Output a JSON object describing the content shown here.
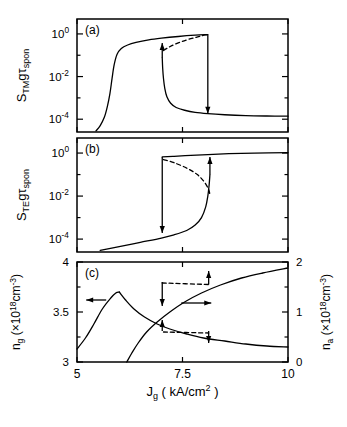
{
  "figure": {
    "background": "#ffffff",
    "ink": "#000000",
    "xlabel_main": "J",
    "xlabel_sub": "g",
    "xlabel_units": "( kA/cm",
    "xlabel_units_exp": "2",
    "xlabel_units_close": " )"
  },
  "chart_data": [
    {
      "type": "line",
      "panel": "a",
      "label": "(a)",
      "title": "",
      "xlabel": "Jg ( kA/cm^2 )",
      "ylabel": "S_TM g tau_spon",
      "ylabel_parts": {
        "base": "S",
        "sub1": "TM",
        "mid": "g",
        "greek": "τ",
        "sub2": "spon"
      },
      "xlim": [
        5,
        10
      ],
      "ylim_log": [
        -4.6,
        0.7
      ],
      "xticks": [
        5,
        7.5,
        10
      ],
      "xticklabels": [
        "5",
        "7.5",
        "10"
      ],
      "yticks_major_log": [
        0,
        -2,
        -4
      ],
      "yticklabels": [
        "10",
        "10",
        "10"
      ],
      "yticklabel_exps": [
        "0",
        "-2",
        "-4"
      ],
      "grid": false,
      "legend": "none",
      "series": [
        {
          "name": "upper-branch-stable",
          "style": "solid",
          "points": [
            [
              5.45,
              -4.55
            ],
            [
              5.55,
              -4.3
            ],
            [
              5.65,
              -3.9
            ],
            [
              5.72,
              -3.4
            ],
            [
              5.78,
              -2.8
            ],
            [
              5.83,
              -2.1
            ],
            [
              5.88,
              -1.45
            ],
            [
              5.95,
              -0.95
            ],
            [
              6.05,
              -0.68
            ],
            [
              6.2,
              -0.52
            ],
            [
              6.4,
              -0.4
            ],
            [
              6.7,
              -0.28
            ],
            [
              7.0,
              -0.2
            ],
            [
              7.4,
              -0.12
            ],
            [
              7.8,
              -0.06
            ],
            [
              8.1,
              -0.03
            ]
          ]
        },
        {
          "name": "lower-branch-stable",
          "style": "solid",
          "points": [
            [
              7.02,
              -1.1
            ],
            [
              7.03,
              -1.6
            ],
            [
              7.05,
              -2.1
            ],
            [
              7.08,
              -2.55
            ],
            [
              7.13,
              -2.95
            ],
            [
              7.22,
              -3.25
            ],
            [
              7.35,
              -3.45
            ],
            [
              7.55,
              -3.58
            ],
            [
              7.8,
              -3.68
            ],
            [
              8.1,
              -3.74
            ],
            [
              8.5,
              -3.79
            ],
            [
              9.0,
              -3.83
            ],
            [
              9.5,
              -3.85
            ],
            [
              10.0,
              -3.86
            ]
          ]
        },
        {
          "name": "unstable-branch",
          "style": "dashed",
          "points": [
            [
              7.05,
              -0.78
            ],
            [
              7.2,
              -0.6
            ],
            [
              7.4,
              -0.42
            ],
            [
              7.6,
              -0.28
            ],
            [
              7.8,
              -0.17
            ],
            [
              7.95,
              -0.09
            ],
            [
              8.08,
              -0.04
            ]
          ]
        },
        {
          "name": "switch-up-vertical",
          "style": "solid",
          "x": 7.02,
          "y_from": -1.1,
          "y_to": -0.42,
          "arrow": "up"
        },
        {
          "name": "switch-down-vertical",
          "style": "solid",
          "x": 8.1,
          "y_from": -0.03,
          "y_to": -3.74,
          "arrow": "down"
        }
      ]
    },
    {
      "type": "line",
      "panel": "b",
      "label": "(b)",
      "xlabel": "Jg ( kA/cm^2 )",
      "ylabel": "S_TE g tau_spon",
      "ylabel_parts": {
        "base": "S",
        "sub1": "TE",
        "mid": "g",
        "greek": "τ",
        "sub2": "spon"
      },
      "xlim": [
        5,
        10
      ],
      "ylim_log": [
        -4.6,
        0.7
      ],
      "xticks": [
        5,
        7.5,
        10
      ],
      "xticklabels": [
        "5",
        "7.5",
        "10"
      ],
      "yticks_major_log": [
        0,
        -2,
        -4
      ],
      "yticklabels": [
        "10",
        "10",
        "10"
      ],
      "yticklabel_exps": [
        "0",
        "-2",
        "-4"
      ],
      "grid": false,
      "legend": "none",
      "series": [
        {
          "name": "lower-branch-stable",
          "style": "solid",
          "points": [
            [
              5.55,
              -4.52
            ],
            [
              6.0,
              -4.35
            ],
            [
              6.5,
              -4.15
            ],
            [
              7.0,
              -3.95
            ],
            [
              7.3,
              -3.8
            ],
            [
              7.6,
              -3.6
            ],
            [
              7.8,
              -3.35
            ],
            [
              7.95,
              -3.0
            ],
            [
              8.05,
              -2.5
            ],
            [
              8.1,
              -2.0
            ],
            [
              8.13,
              -1.5
            ],
            [
              8.15,
              -1.0
            ]
          ]
        },
        {
          "name": "upper-branch-stable",
          "style": "solid",
          "points": [
            [
              7.02,
              -0.18
            ],
            [
              7.3,
              -0.15
            ],
            [
              7.7,
              -0.11
            ],
            [
              8.1,
              -0.07
            ],
            [
              8.6,
              -0.03
            ],
            [
              9.2,
              0.0
            ],
            [
              10.0,
              0.02
            ]
          ]
        },
        {
          "name": "unstable-branch",
          "style": "dashed",
          "points": [
            [
              7.05,
              -0.3
            ],
            [
              7.3,
              -0.45
            ],
            [
              7.6,
              -0.7
            ],
            [
              7.85,
              -1.0
            ],
            [
              8.02,
              -1.35
            ],
            [
              8.12,
              -1.7
            ],
            [
              8.15,
              -1.95
            ]
          ]
        },
        {
          "name": "switch-down-vertical",
          "style": "solid",
          "x": 7.02,
          "y_from": -0.18,
          "y_to": -3.72,
          "arrow": "down"
        },
        {
          "name": "switch-up-vertical",
          "style": "solid",
          "x": 8.15,
          "y_from": -1.0,
          "y_to": -0.18,
          "arrow": "up"
        }
      ]
    },
    {
      "type": "line",
      "panel": "c",
      "label": "(c)",
      "xlabel": "Jg ( kA/cm^2 )",
      "ylabel_left": "n_g ( x10^18 cm^-3 )",
      "ylabel_right": "n_a ( x10^18 cm^-3 )",
      "ylabel_left_parts": {
        "base": "n",
        "sub": "g",
        "open": " (",
        "mult": "×10",
        "exp": "18",
        "unit": "cm",
        "unitexp": "-3",
        "close": ")"
      },
      "ylabel_right_parts": {
        "base": "n",
        "sub": "a",
        "open": " (",
        "mult": "×10",
        "exp": "18",
        "unit": "cm",
        "unitexp": "-3",
        "close": ")"
      },
      "xlim": [
        5,
        10
      ],
      "ylim_left": [
        3,
        4
      ],
      "ylim_right": [
        0,
        2
      ],
      "xticks": [
        5,
        7.5,
        10
      ],
      "xticklabels": [
        "5",
        "7.5",
        "10"
      ],
      "yticks_left": [
        3,
        3.5,
        4
      ],
      "yticklabels_left": [
        "3",
        "3.5",
        "4"
      ],
      "yticks_right": [
        0,
        1,
        2
      ],
      "yticklabels_right": [
        "0",
        "1",
        "2"
      ],
      "grid": false,
      "legend": "none",
      "annotations": [
        {
          "name": "left-axis-pointer",
          "type": "arrow-left",
          "x": 5.55,
          "y_left": 3.62
        },
        {
          "name": "right-axis-pointer",
          "type": "arrow-right",
          "x": 7.85,
          "y_right": 1.18
        }
      ],
      "series": [
        {
          "name": "ng-rising-branch",
          "axis": "left",
          "style": "solid",
          "points": [
            [
              5.0,
              3.13
            ],
            [
              5.2,
              3.24
            ],
            [
              5.4,
              3.38
            ],
            [
              5.6,
              3.53
            ],
            [
              5.8,
              3.64
            ],
            [
              5.92,
              3.69
            ],
            [
              6.0,
              3.7
            ]
          ]
        },
        {
          "name": "ng-falling-branch",
          "axis": "left",
          "style": "solid",
          "points": [
            [
              6.0,
              3.7
            ],
            [
              6.15,
              3.62
            ],
            [
              6.35,
              3.53
            ],
            [
              6.6,
              3.45
            ],
            [
              6.9,
              3.38
            ],
            [
              7.2,
              3.33
            ],
            [
              7.6,
              3.28
            ],
            [
              8.0,
              3.24
            ],
            [
              8.5,
              3.21
            ],
            [
              9.0,
              3.18
            ],
            [
              9.5,
              3.16
            ],
            [
              10.0,
              3.15
            ]
          ]
        },
        {
          "name": "ng-lower-branch",
          "axis": "left",
          "style": "solid",
          "points": [
            [
              6.18,
              3.0
            ],
            [
              6.3,
              3.09
            ],
            [
              6.45,
              3.19
            ],
            [
              6.65,
              3.3
            ],
            [
              6.9,
              3.4
            ],
            [
              7.2,
              3.5
            ],
            [
              7.55,
              3.6
            ],
            [
              7.95,
              3.69
            ],
            [
              8.4,
              3.77
            ],
            [
              8.9,
              3.84
            ],
            [
              9.4,
              3.89
            ],
            [
              10.0,
              3.94
            ]
          ]
        },
        {
          "name": "na-upper-hysteresis-left-drop",
          "axis": "right",
          "style": "solid",
          "x": 7.02,
          "y_from": 1.6,
          "y_to": 1.12,
          "arrow": "down"
        },
        {
          "name": "na-upper-hysteresis-right-rise",
          "axis": "right",
          "style": "solid",
          "x": 8.12,
          "y_from": 1.55,
          "y_to": 1.82,
          "arrow": "up"
        },
        {
          "name": "na-upper-dashed-connector",
          "axis": "right",
          "style": "dashed",
          "points": [
            [
              7.02,
              1.58
            ],
            [
              8.12,
              1.55
            ]
          ]
        },
        {
          "name": "na-lower-hysteresis-left-rise",
          "axis": "right",
          "style": "solid",
          "x": 7.02,
          "y_from": 0.62,
          "y_to": 0.84,
          "arrow": "up"
        },
        {
          "name": "na-lower-hysteresis-right-drop",
          "axis": "right",
          "style": "solid",
          "x": 8.12,
          "y_from": 0.62,
          "y_to": 0.38,
          "arrow": "down"
        },
        {
          "name": "na-lower-dashed-connector",
          "axis": "right",
          "style": "dashed",
          "points": [
            [
              7.05,
              0.6
            ],
            [
              8.12,
              0.58
            ]
          ]
        }
      ]
    }
  ]
}
